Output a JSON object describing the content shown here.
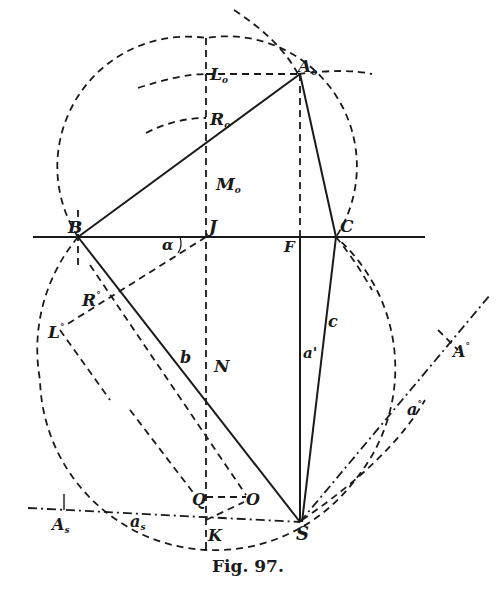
{
  "figure": {
    "caption": "Fig. 97.",
    "points": {
      "A0": {
        "label": "A",
        "sub": "o"
      },
      "L0": {
        "label": "L",
        "sub": "o"
      },
      "R0": {
        "label": "R",
        "sub": "o"
      },
      "M0": {
        "label": "M",
        "sub": "o"
      },
      "B": {
        "label": "B"
      },
      "J": {
        "label": "J"
      },
      "F": {
        "label": "F"
      },
      "C": {
        "label": "C"
      },
      "alpha": {
        "label": "α"
      },
      "Rdeg": {
        "label": "R",
        "sup": "°"
      },
      "Ldeg": {
        "label": "L",
        "sup": "°"
      },
      "N": {
        "label": "N"
      },
      "b": {
        "label": "b"
      },
      "aprime": {
        "label": "a'"
      },
      "c": {
        "label": "c"
      },
      "Adeg": {
        "label": "A",
        "sup": "°"
      },
      "adeg": {
        "label": "a",
        "sup": "°"
      },
      "Q": {
        "label": "Q"
      },
      "O": {
        "label": "O"
      },
      "K": {
        "label": "K"
      },
      "S": {
        "label": "S"
      },
      "As": {
        "label": "A",
        "sub": "s"
      },
      "as": {
        "label": "a",
        "sub": "s"
      }
    }
  }
}
